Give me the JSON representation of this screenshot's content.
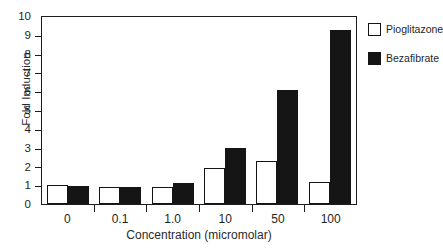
{
  "chart_data": {
    "type": "bar",
    "title": "",
    "xlabel": "Concentration (micromolar)",
    "ylabel": "Fold Induction",
    "categories": [
      "0",
      "0.1",
      "1.0",
      "10",
      "50",
      "100"
    ],
    "series": [
      {
        "name": "Pioglitazone",
        "style": "open",
        "color": "#ffffff",
        "values": [
          1.0,
          0.9,
          0.9,
          1.9,
          2.3,
          1.2
        ]
      },
      {
        "name": "Bezafibrate",
        "style": "solid",
        "color": "#151515",
        "values": [
          0.95,
          0.9,
          1.1,
          3.0,
          6.1,
          9.3
        ]
      }
    ],
    "ylim": [
      0,
      10
    ],
    "yticks": [
      "0",
      "1",
      "2",
      "3",
      "4",
      "5",
      "6",
      "7",
      "8",
      "9",
      "10"
    ],
    "grid": false,
    "legend_position": "right"
  },
  "legend": {
    "entries": [
      {
        "label": "Pioglitazone"
      },
      {
        "label": "Bezafibrate"
      }
    ]
  }
}
